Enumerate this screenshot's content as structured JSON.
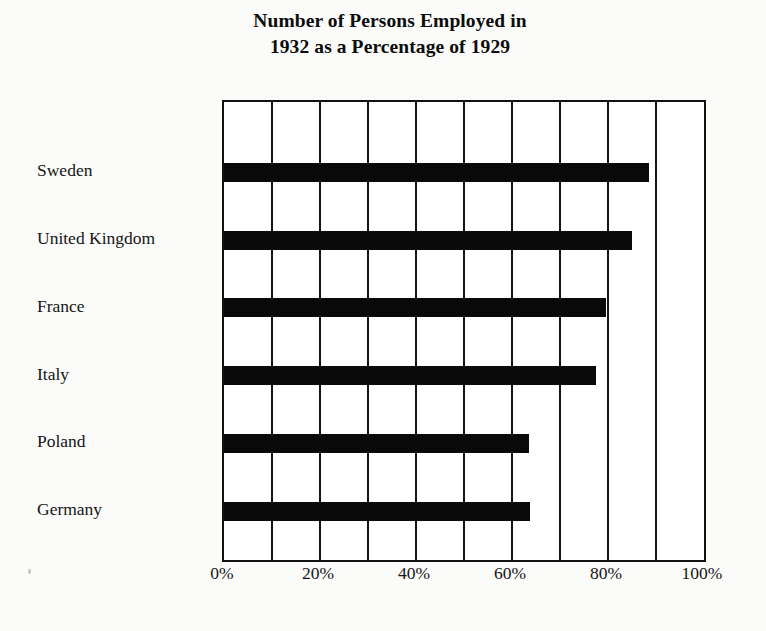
{
  "chart_data": {
    "type": "bar",
    "orientation": "horizontal",
    "title": "Number of Persons Employed in 1932 as a Percentage of 1929",
    "title_lines": [
      "Number of Persons Employed in",
      "1932 as a Percentage of 1929"
    ],
    "categories": [
      "Sweden",
      "United Kingdom",
      "France",
      "Italy",
      "Poland",
      "Germany"
    ],
    "values": [
      88.5,
      85,
      79.5,
      77.5,
      63.5,
      63.75
    ],
    "xlabel": "",
    "ylabel": "",
    "xlim": [
      0,
      100
    ],
    "xtick_values": [
      0,
      20,
      40,
      60,
      80,
      100
    ],
    "xtick_labels": [
      "0%",
      "20%",
      "40%",
      "60%",
      "80%",
      "100%"
    ],
    "gridline_values": [
      0,
      10,
      20,
      30,
      40,
      50,
      60,
      70,
      80,
      90,
      100
    ],
    "grid": true,
    "legend": false,
    "bar_color": "#090909",
    "plot_background": "#ffffff",
    "axis_color": "#121212"
  }
}
